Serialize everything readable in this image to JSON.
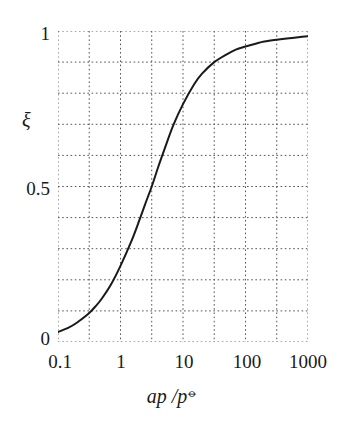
{
  "figure": {
    "background_color": "#ffffff",
    "ink_color": "#1a1a1a",
    "grid_color": "#555555"
  },
  "axes": {
    "y_axis_label": "ξ",
    "x_axis_label_main": "ap /p",
    "x_axis_label_superscript": "⦵",
    "y_tick_labels": [
      "1",
      "0.5",
      "0"
    ],
    "x_tick_labels": [
      "0.1",
      "1",
      "10",
      "100",
      "1000"
    ]
  },
  "chart_data": {
    "type": "line",
    "title": "",
    "xlabel": "ap /p⦵",
    "ylabel": "ξ",
    "xscale": "log",
    "yscale": "linear",
    "xlim": [
      0.1,
      1000
    ],
    "ylim": [
      0,
      1
    ],
    "grid": true,
    "grid_style": "dotted",
    "legend": "none",
    "x_ticks": [
      0.1,
      1,
      10,
      100,
      1000
    ],
    "x_tick_labels": [
      "0.1",
      "1",
      "10",
      "100",
      "1000"
    ],
    "y_ticks": [
      0,
      0.5,
      1
    ],
    "y_tick_labels": [
      "0",
      "0.5",
      "1"
    ],
    "x_minor_gridlines": [
      0.316,
      3.16,
      31.6,
      316
    ],
    "y_gridlines": [
      0.0,
      0.1,
      0.2,
      0.3,
      0.4,
      0.5,
      0.6,
      0.7,
      0.8,
      0.9,
      1.0
    ],
    "series": [
      {
        "name": "extent of reaction",
        "color": "#1a1a1a",
        "line_width": 2,
        "x": [
          0.1,
          0.15,
          0.2,
          0.3,
          0.4,
          0.5,
          0.7,
          1.0,
          1.5,
          2.0,
          2.5,
          3.16,
          4.0,
          5.0,
          7.0,
          10.0,
          15.0,
          20.0,
          31.6,
          50.0,
          70.0,
          100.0,
          150.0,
          200.0,
          316.0,
          500.0,
          700.0,
          1000.0
        ],
        "y": [
          0.032,
          0.047,
          0.062,
          0.089,
          0.115,
          0.139,
          0.184,
          0.245,
          0.325,
          0.391,
          0.445,
          0.5,
          0.562,
          0.617,
          0.697,
          0.765,
          0.828,
          0.862,
          0.9,
          0.925,
          0.94,
          0.95,
          0.96,
          0.966,
          0.972,
          0.977,
          0.98,
          0.983
        ]
      }
    ]
  }
}
